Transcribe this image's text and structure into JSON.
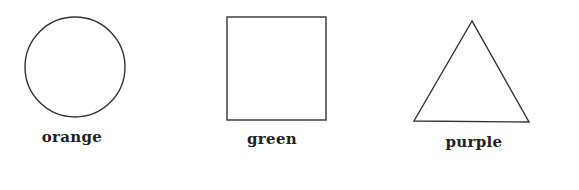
{
  "figure": {
    "shapes": [
      {
        "type": "circle",
        "label": "orange"
      },
      {
        "type": "square",
        "label": "green"
      },
      {
        "type": "triangle",
        "label": "purple"
      }
    ],
    "stroke_color": "#333333",
    "background": "#ffffff"
  }
}
